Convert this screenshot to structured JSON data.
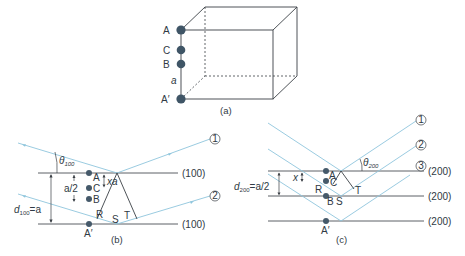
{
  "figure": {
    "panel_a": {
      "caption": "(a)",
      "atoms": [
        {
          "label": "A"
        },
        {
          "label": "C"
        },
        {
          "label": "B"
        },
        {
          "label": "A′"
        }
      ],
      "edge_label": "a"
    },
    "panel_b": {
      "caption": "(b)",
      "plane_label": "(100)",
      "theta": "θ",
      "theta_sub": "100",
      "d": "d",
      "d_sub": "100",
      "d_value": "=a",
      "half": "a/2",
      "xa": "xa",
      "atoms": [
        "A",
        "C",
        "B",
        "A′"
      ],
      "points": {
        "R": "R",
        "S": "S",
        "T": "T"
      },
      "rays": [
        "①",
        "②"
      ]
    },
    "panel_c": {
      "caption": "(c)",
      "plane_label": "(200)",
      "theta": "θ",
      "theta_sub": "200",
      "d": "d",
      "d_sub": "200",
      "d_value": "=a/2",
      "x": "x",
      "atoms": [
        "A",
        "C",
        "B",
        "A′"
      ],
      "points": {
        "R": "R",
        "S": "S",
        "T": "T"
      },
      "rays": [
        "①",
        "②",
        "③"
      ]
    },
    "colors": {
      "ray": "#8ec5dc",
      "atom": "#3f5566",
      "line": "#3a3f45"
    }
  }
}
